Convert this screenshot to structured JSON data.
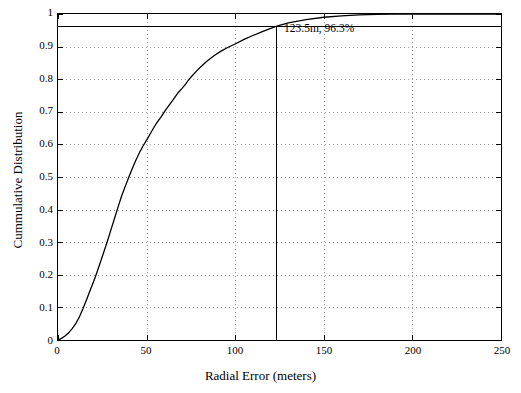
{
  "chart_data": {
    "type": "line",
    "title": "",
    "xlabel": "Radial Error (meters)",
    "ylabel": "Cummulative Distribution",
    "xlim": [
      0,
      250
    ],
    "ylim": [
      0,
      1
    ],
    "xticks": [
      0,
      50,
      100,
      150,
      200,
      250
    ],
    "xticklabels": [
      "0",
      "50",
      "100",
      "150",
      "200",
      "250"
    ],
    "yticks": [
      0,
      0.1,
      0.2,
      0.3,
      0.4,
      0.5,
      0.6,
      0.7,
      0.8,
      0.9,
      1
    ],
    "yticklabels": [
      "0",
      "0.1",
      "0.2",
      "0.3",
      "0.4",
      "0.5",
      "0.6",
      "0.7",
      "0.8",
      "0.9",
      "1"
    ],
    "grid": true,
    "legend": null,
    "line_color": "#000000",
    "annotations": [
      {
        "name": "marker-label",
        "text": "123.5m, 96.3%",
        "x": 123.5,
        "y": 0.963
      }
    ],
    "markers": [
      {
        "name": "vertical-marker-line",
        "x": 123.5,
        "y_from": 0,
        "y_to": 0.963
      },
      {
        "name": "horizontal-marker-line",
        "y": 0.963,
        "x_from": 0,
        "x_to": 250
      }
    ],
    "series": [
      {
        "name": "cumulative-distribution",
        "x": [
          0,
          2,
          4,
          6,
          8,
          10,
          12,
          14,
          16,
          18,
          20,
          22,
          24,
          26,
          28,
          30,
          32,
          34,
          36,
          38,
          40,
          42,
          44,
          46,
          48,
          50,
          52,
          54,
          56,
          58,
          60,
          62,
          64,
          66,
          68,
          70,
          72,
          74,
          76,
          78,
          80,
          84,
          88,
          92,
          96,
          100,
          105,
          110,
          115,
          120,
          123.5,
          130,
          140,
          150,
          160,
          170,
          180,
          190,
          200,
          210,
          220,
          230,
          240,
          250
        ],
        "y": [
          0.0,
          0.005,
          0.012,
          0.022,
          0.035,
          0.05,
          0.07,
          0.095,
          0.122,
          0.15,
          0.178,
          0.208,
          0.24,
          0.272,
          0.305,
          0.34,
          0.375,
          0.41,
          0.443,
          0.472,
          0.5,
          0.527,
          0.552,
          0.575,
          0.595,
          0.613,
          0.632,
          0.651,
          0.668,
          0.683,
          0.7,
          0.715,
          0.73,
          0.745,
          0.76,
          0.772,
          0.785,
          0.8,
          0.812,
          0.824,
          0.835,
          0.855,
          0.872,
          0.886,
          0.898,
          0.908,
          0.922,
          0.934,
          0.945,
          0.956,
          0.963,
          0.973,
          0.983,
          0.99,
          0.994,
          0.997,
          0.999,
          1.0,
          1.0,
          1.0,
          1.0,
          1.0,
          1.0,
          1.0
        ]
      }
    ]
  }
}
